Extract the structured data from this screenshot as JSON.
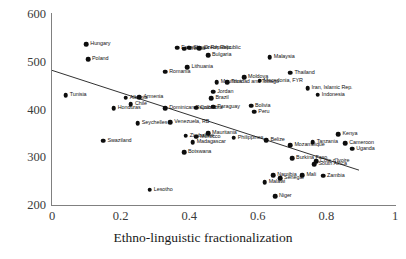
{
  "chart_data": {
    "type": "scatter",
    "title": "",
    "xlabel": "Ethno-linguistic fractionalization",
    "ylabel": "",
    "xlim": [
      0,
      1
    ],
    "ylim": [
      200,
      600
    ],
    "xticks": [
      "0",
      "0.2",
      "0.4",
      "0.6",
      "0.8",
      "1"
    ],
    "xtick_values": [
      0,
      0.2,
      0.4,
      0.6,
      0.8,
      1
    ],
    "yticks": [
      "600",
      "500",
      "400",
      "300",
      "200"
    ],
    "ytick_values": [
      600,
      500,
      400,
      300,
      200
    ],
    "grid": false,
    "legend": "none",
    "marker": "filled-circle",
    "marker_color": "#0d0d0d",
    "trendline": {
      "visible": true,
      "color": "#1a1a1a",
      "x_start": 0.0,
      "y_start": 482,
      "x_end": 0.895,
      "y_end": 273
    },
    "points": [
      {
        "label": "Hungary",
        "x": 0.1,
        "y": 537,
        "lpos": "right"
      },
      {
        "label": "Poland",
        "x": 0.105,
        "y": 505,
        "lpos": "right"
      },
      {
        "label": "Tunisia",
        "x": 0.04,
        "y": 430,
        "lpos": "right"
      },
      {
        "label": "Estonia",
        "x": 0.365,
        "y": 529,
        "lpos": "right"
      },
      {
        "label": "Croatia",
        "x": 0.385,
        "y": 527,
        "lpos": "right"
      },
      {
        "label": "Slovak Republic",
        "x": 0.4,
        "y": 529,
        "lpos": "right"
      },
      {
        "label": "Czech Republic",
        "x": 0.43,
        "y": 528,
        "lpos": "right"
      },
      {
        "label": "Bulgaria",
        "x": 0.455,
        "y": 514,
        "lpos": "right"
      },
      {
        "label": "Lithuania",
        "x": 0.395,
        "y": 489,
        "lpos": "right"
      },
      {
        "label": "Romania",
        "x": 0.33,
        "y": 479,
        "lpos": "right"
      },
      {
        "label": "Macedonia, FYR",
        "x": 0.605,
        "y": 460,
        "lpos": "right"
      },
      {
        "label": "Moldova",
        "x": 0.56,
        "y": 468,
        "lpos": "right"
      },
      {
        "label": "Malaysia",
        "x": 0.635,
        "y": 510,
        "lpos": "right"
      },
      {
        "label": "Thailand",
        "x": 0.695,
        "y": 477,
        "lpos": "right"
      },
      {
        "label": "Iran, Islamic Rep.",
        "x": 0.745,
        "y": 444,
        "lpos": "right"
      },
      {
        "label": "Indonesia",
        "x": 0.775,
        "y": 431,
        "lpos": "right"
      },
      {
        "label": "Mauritius",
        "x": 0.48,
        "y": 457,
        "lpos": "right"
      },
      {
        "label": "Trinidad and Tobago",
        "x": 0.51,
        "y": 457,
        "lpos": "right"
      },
      {
        "label": "Jordan",
        "x": 0.47,
        "y": 437,
        "lpos": "right"
      },
      {
        "label": "Brazil",
        "x": 0.465,
        "y": 424,
        "lpos": "right"
      },
      {
        "label": "Albania",
        "x": 0.215,
        "y": 425,
        "lpos": "right"
      },
      {
        "label": "Armenia",
        "x": 0.255,
        "y": 426,
        "lpos": "right"
      },
      {
        "label": "Chile",
        "x": 0.23,
        "y": 411,
        "lpos": "right"
      },
      {
        "label": "Honduras",
        "x": 0.18,
        "y": 403,
        "lpos": "right"
      },
      {
        "label": "Dominican Republic",
        "x": 0.33,
        "y": 403,
        "lpos": "right"
      },
      {
        "label": "Colombia",
        "x": 0.42,
        "y": 404,
        "lpos": "right"
      },
      {
        "label": "Paraguay",
        "x": 0.47,
        "y": 406,
        "lpos": "right"
      },
      {
        "label": "Bolivia",
        "x": 0.58,
        "y": 408,
        "lpos": "right"
      },
      {
        "label": "Peru",
        "x": 0.59,
        "y": 395,
        "lpos": "right"
      },
      {
        "label": "Seychelles",
        "x": 0.25,
        "y": 371,
        "lpos": "right"
      },
      {
        "label": "Venezuela, RB",
        "x": 0.345,
        "y": 373,
        "lpos": "right"
      },
      {
        "label": "Swaziland",
        "x": 0.15,
        "y": 335,
        "lpos": "right"
      },
      {
        "label": "Zimbabwe",
        "x": 0.39,
        "y": 345,
        "lpos": "right"
      },
      {
        "label": "Morocco",
        "x": 0.42,
        "y": 343,
        "lpos": "right"
      },
      {
        "label": "Mauritania",
        "x": 0.455,
        "y": 350,
        "lpos": "right"
      },
      {
        "label": "Madagascar",
        "x": 0.41,
        "y": 332,
        "lpos": "right"
      },
      {
        "label": "Botswana",
        "x": 0.385,
        "y": 311,
        "lpos": "right"
      },
      {
        "label": "Philippines",
        "x": 0.53,
        "y": 341,
        "lpos": "right"
      },
      {
        "label": "Belize",
        "x": 0.625,
        "y": 336,
        "lpos": "right"
      },
      {
        "label": "Mozambique",
        "x": 0.695,
        "y": 325,
        "lpos": "right"
      },
      {
        "label": "Tanzania",
        "x": 0.76,
        "y": 331,
        "lpos": "right"
      },
      {
        "label": "Kenya",
        "x": 0.835,
        "y": 348,
        "lpos": "right"
      },
      {
        "label": "Cameroon",
        "x": 0.855,
        "y": 329,
        "lpos": "right"
      },
      {
        "label": "Uganda",
        "x": 0.875,
        "y": 318,
        "lpos": "right"
      },
      {
        "label": "Burkina Faso",
        "x": 0.7,
        "y": 298,
        "lpos": "right"
      },
      {
        "label": "Cote d'Ivoire",
        "x": 0.77,
        "y": 292,
        "lpos": "right"
      },
      {
        "label": "South Africa",
        "x": 0.765,
        "y": 286,
        "lpos": "right"
      },
      {
        "label": "Namibia",
        "x": 0.645,
        "y": 262,
        "lpos": "right"
      },
      {
        "label": "Senegal",
        "x": 0.665,
        "y": 256,
        "lpos": "right"
      },
      {
        "label": "Mali",
        "x": 0.73,
        "y": 263,
        "lpos": "right"
      },
      {
        "label": "Zambia",
        "x": 0.79,
        "y": 261,
        "lpos": "right"
      },
      {
        "label": "Malawi",
        "x": 0.62,
        "y": 248,
        "lpos": "right"
      },
      {
        "label": "Niger",
        "x": 0.65,
        "y": 218,
        "lpos": "right"
      },
      {
        "label": "Lesotho",
        "x": 0.285,
        "y": 232,
        "lpos": "right"
      }
    ]
  }
}
